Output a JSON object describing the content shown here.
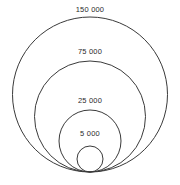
{
  "figure": {
    "background_color": "#ffffff",
    "stroke_color": "#3a3a3a",
    "label_color": "#2b2b2b"
  },
  "chart_data": {
    "type": "bubble",
    "title": "",
    "subtitle": "",
    "xlabel": "",
    "ylabel": "",
    "grid": false,
    "legend": "none",
    "anchor": "bottom-tangent",
    "tangent_point": {
      "x": 90,
      "y": 172
    },
    "categories": [
      "150 000",
      "75 000",
      "25 000",
      "5 000"
    ],
    "values": [
      150000,
      75000,
      25000,
      5000
    ],
    "labels": [
      "150 000",
      "75 000",
      "25 000",
      "5 000"
    ],
    "circles": [
      {
        "label": "150 000",
        "value": 150000,
        "cx": 90,
        "cy": 94.5,
        "r": 77.5,
        "diameter_px": 155,
        "label_top_px": 5
      },
      {
        "label": "75 000",
        "value": 75000,
        "cx": 90,
        "cy": 116.5,
        "r": 55.5,
        "diameter_px": 111,
        "label_top_px": 47
      },
      {
        "label": "25 000",
        "value": 25000,
        "cx": 90,
        "cy": 141,
        "r": 31,
        "diameter_px": 62,
        "label_top_px": 96
      },
      {
        "label": "5 000",
        "value": 5000,
        "cx": 90,
        "cy": 159,
        "r": 13,
        "diameter_px": 26,
        "label_top_px": 129
      }
    ]
  }
}
